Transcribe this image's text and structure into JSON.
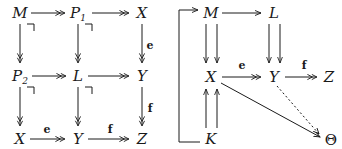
{
  "figure": {
    "kind": "commutative-diagram-pair",
    "ink_color": "#1a1a1a",
    "background_color": "#ffffff"
  },
  "left_diagram": {
    "name": "pullback-grid-diagram",
    "nodes": [
      {
        "id": "M",
        "label": "M",
        "sub": "",
        "x": 20,
        "y": 13
      },
      {
        "id": "P1",
        "label": "P",
        "sub": "1",
        "x": 78,
        "y": 13
      },
      {
        "id": "X1",
        "label": "X",
        "sub": "",
        "x": 142,
        "y": 13
      },
      {
        "id": "P2",
        "label": "P",
        "sub": "2",
        "x": 20,
        "y": 76
      },
      {
        "id": "L",
        "label": "L",
        "sub": "",
        "x": 78,
        "y": 76
      },
      {
        "id": "Y1",
        "label": "Y",
        "sub": "",
        "x": 142,
        "y": 76
      },
      {
        "id": "X2",
        "label": "X",
        "sub": "",
        "x": 20,
        "y": 139
      },
      {
        "id": "Y2",
        "label": "Y",
        "sub": "",
        "x": 78,
        "y": 139
      },
      {
        "id": "Z1",
        "label": "Z",
        "sub": "",
        "x": 142,
        "y": 139
      }
    ],
    "edges": [
      {
        "from": "M",
        "to": "P1",
        "style": "epi-horizontal",
        "label": ""
      },
      {
        "from": "P1",
        "to": "X1",
        "style": "epi-horizontal",
        "label": ""
      },
      {
        "from": "P2",
        "to": "L",
        "style": "epi-horizontal",
        "label": ""
      },
      {
        "from": "L",
        "to": "Y1",
        "style": "epi-horizontal",
        "label": ""
      },
      {
        "from": "X2",
        "to": "Y2",
        "style": "epi-horizontal",
        "label": "e"
      },
      {
        "from": "Y2",
        "to": "Z1",
        "style": "epi-horizontal",
        "label": "f"
      },
      {
        "from": "M",
        "to": "P2",
        "style": "epi-vertical",
        "label": ""
      },
      {
        "from": "P1",
        "to": "L",
        "style": "epi-vertical",
        "label": ""
      },
      {
        "from": "X1",
        "to": "Y1",
        "style": "epi-vertical",
        "label": "e"
      },
      {
        "from": "P2",
        "to": "X2",
        "style": "epi-vertical",
        "label": ""
      },
      {
        "from": "L",
        "to": "Y2",
        "style": "epi-vertical",
        "label": ""
      },
      {
        "from": "Y1",
        "to": "Z1",
        "style": "epi-vertical",
        "label": "f"
      }
    ],
    "pullback_markers": [
      {
        "at": "M-P1-P2-L",
        "x": 33,
        "y": 26
      },
      {
        "at": "P1-X1-L-Y1",
        "x": 91,
        "y": 26
      },
      {
        "at": "P2-L-X2-Y2",
        "x": 33,
        "y": 89
      },
      {
        "at": "L-Y1-Y2-Z1",
        "x": 91,
        "y": 89
      }
    ],
    "arrow_labels": [
      {
        "text": "e",
        "x": 150,
        "y": 45
      },
      {
        "text": "f",
        "x": 150,
        "y": 108
      },
      {
        "text": "e",
        "x": 47,
        "y": 129
      },
      {
        "text": "f",
        "x": 110,
        "y": 129
      }
    ]
  },
  "right_diagram": {
    "name": "coequalizer-kernel-pair-diagram",
    "nodes": [
      {
        "id": "M",
        "label": "M",
        "sub": "",
        "x": 211,
        "y": 13
      },
      {
        "id": "L",
        "label": "L",
        "sub": "",
        "x": 274,
        "y": 13
      },
      {
        "id": "X",
        "label": "X",
        "sub": "",
        "x": 211,
        "y": 76
      },
      {
        "id": "Y",
        "label": "Y",
        "sub": "",
        "x": 274,
        "y": 76
      },
      {
        "id": "Z",
        "label": "Z",
        "sub": "",
        "x": 329,
        "y": 76
      },
      {
        "id": "K",
        "label": "K",
        "sub": "",
        "x": 211,
        "y": 139
      },
      {
        "id": "Theta",
        "label": "Θ",
        "sub": "",
        "x": 330,
        "y": 139,
        "upright": true
      }
    ],
    "edges": [
      {
        "from": "M",
        "to": "L",
        "style": "mono-horizontal",
        "label": ""
      },
      {
        "from": "M",
        "to": "X",
        "style": "parallel-pair-down",
        "label": ""
      },
      {
        "from": "L",
        "to": "Y",
        "style": "parallel-pair-down",
        "label": ""
      },
      {
        "from": "K",
        "to": "X",
        "style": "parallel-pair-up",
        "label": ""
      },
      {
        "from": "X",
        "to": "Y",
        "style": "epi-horizontal",
        "label": "e"
      },
      {
        "from": "Y",
        "to": "Z",
        "style": "epi-horizontal",
        "label": "f"
      },
      {
        "from": "X",
        "to": "Theta",
        "style": "solid-diagonal",
        "label": ""
      },
      {
        "from": "Y",
        "to": "Theta",
        "style": "dotted-diagonal",
        "label": ""
      },
      {
        "from": "K",
        "to": "M",
        "style": "wrap-around-left",
        "label": ""
      }
    ],
    "arrow_labels": [
      {
        "text": "e",
        "x": 242,
        "y": 65
      },
      {
        "text": "f",
        "x": 304,
        "y": 65
      }
    ]
  }
}
